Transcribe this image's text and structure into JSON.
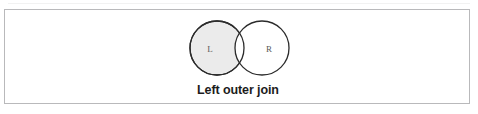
{
  "figure": {
    "caption": "Left outer join",
    "diagram_type": "venn-diagram",
    "border_color": "#b9b9bb",
    "background_color": "#ffffff"
  },
  "venn": {
    "stroke_color": "#2b2b2b",
    "left_circle": {
      "label": "L",
      "fill": "#ebebeb",
      "shaded": "true",
      "cx": 212,
      "cy": 38,
      "r": 27
    },
    "right_circle": {
      "label": "R",
      "fill": "#ffffff",
      "shaded": "false",
      "cx": 257,
      "cy": 38,
      "r": 27
    },
    "label_color": "#5a5a5a"
  }
}
